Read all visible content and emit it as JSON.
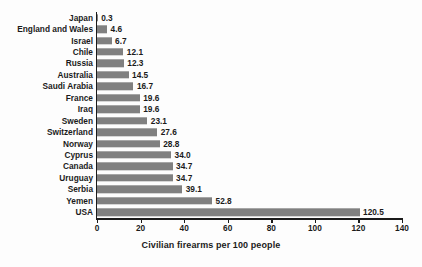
{
  "chart_data": {
    "type": "bar",
    "orientation": "horizontal",
    "title": "",
    "xlabel": "Civilian firearms per 100 people",
    "ylabel": "",
    "xlim": [
      0,
      140
    ],
    "xticks": [
      0,
      20,
      40,
      60,
      80,
      100,
      120,
      140
    ],
    "grid": false,
    "legend": null,
    "bar_color": "#808080",
    "axis_color": "#1b1b1b",
    "background": "#fdfdfd",
    "categories": [
      "Japan",
      "England and Wales",
      "Israel",
      "Chile",
      "Russia",
      "Australia",
      "Saudi Arabia",
      "France",
      "Iraq",
      "Sweden",
      "Switzerland",
      "Norway",
      "Cyprus",
      "Canada",
      "Uruguay",
      "Serbia",
      "Yemen",
      "USA"
    ],
    "values": [
      0.3,
      4.6,
      6.7,
      12.1,
      12.3,
      14.5,
      16.7,
      19.6,
      19.6,
      23.1,
      27.6,
      28.8,
      34.0,
      34.7,
      34.7,
      39.1,
      52.8,
      120.5
    ],
    "value_labels": [
      "0.3",
      "4.6",
      "6.7",
      "12.1",
      "12.3",
      "14.5",
      "16.7",
      "19.6",
      "19.6",
      "23.1",
      "27.6",
      "28.8",
      "34.0",
      "34.7",
      "34.7",
      "39.1",
      "52.8",
      "120.5"
    ],
    "tick_labels": [
      "0",
      "20",
      "40",
      "60",
      "80",
      "100",
      "120",
      "140"
    ]
  }
}
